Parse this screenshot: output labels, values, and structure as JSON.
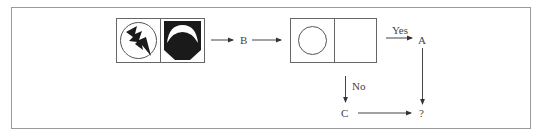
{
  "diagram": {
    "type": "figure-matrix-flow",
    "nodes": {
      "b_label": "B",
      "a_label": "A",
      "c_label": "C",
      "q_label": "?"
    },
    "edges": {
      "yes_label": "Yes",
      "no_label": "No"
    },
    "panels": [
      {
        "name": "first-pair-left",
        "icon": "lightning-in-circle-icon"
      },
      {
        "name": "first-pair-right",
        "icon": "black-shield-with-crescent-icon"
      },
      {
        "name": "second-pair-left",
        "icon": "empty-circle-icon"
      },
      {
        "name": "second-pair-right",
        "icon": "empty"
      }
    ],
    "colors": {
      "stroke": "#555555",
      "fill_dark": "#1a1a1a",
      "frame": "#9a9a9a"
    }
  }
}
